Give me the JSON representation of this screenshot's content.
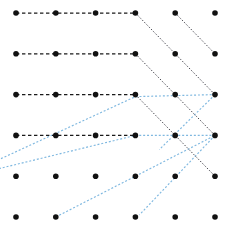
{
  "canvas": {
    "width": 233,
    "height": 235,
    "background": "#ffffff",
    "title": "dot-grid routing diagram"
  },
  "grid": {
    "rows": 6,
    "cols": 6,
    "x_origin": 16,
    "y_origin": 13,
    "x_step": 39.8,
    "y_step": 40.8,
    "dot_radius": 2.8,
    "dot_color": "#111111",
    "dot_count": 36
  },
  "styles": {
    "black_dashed": {
      "color": "#1a1a1a",
      "width": 1.25,
      "dash": "3.4 2.6",
      "name": "black-dashed"
    },
    "black_dotted": {
      "color": "#4a4a52",
      "width": 1.0,
      "dash": "1.5 1.7",
      "name": "black-dotted-diagonal"
    },
    "blue_dotted": {
      "color": "#7fb8e0",
      "width": 1.15,
      "dash": "2.0 1.9",
      "name": "blue-dotted-diagonal"
    }
  },
  "paths": {
    "horizontal_black": [
      {
        "name": "row-1-horizontal",
        "points": [
          [
            1,
            1
          ],
          [
            4,
            1
          ]
        ]
      },
      {
        "name": "row-2-horizontal",
        "points": [
          [
            1,
            2
          ],
          [
            4,
            2
          ]
        ]
      },
      {
        "name": "row-3-horizontal",
        "points": [
          [
            1,
            3
          ],
          [
            4,
            3
          ]
        ]
      },
      {
        "name": "row-4-horizontal",
        "points": [
          [
            1,
            4
          ],
          [
            4,
            4
          ]
        ]
      }
    ],
    "diagonal_black": [
      {
        "name": "black-diag-from-r1c4",
        "points": [
          [
            4,
            1
          ],
          [
            6,
            3
          ]
        ]
      },
      {
        "name": "black-diag-from-r2c4",
        "points": [
          [
            4,
            2
          ],
          [
            6,
            4
          ]
        ]
      },
      {
        "name": "black-diag-from-r3c4",
        "points": [
          [
            4,
            3
          ],
          [
            6,
            5
          ]
        ]
      },
      {
        "name": "black-diag-from-r1c5",
        "points": [
          [
            5,
            1
          ],
          [
            6,
            2
          ]
        ]
      }
    ],
    "diagonal_blue": [
      {
        "name": "blue-chevron-upper",
        "points": [
          [
            0.0,
            4.85
          ],
          [
            4,
            3.05
          ],
          [
            6,
            3
          ]
        ]
      },
      {
        "name": "blue-chevron-mid",
        "points": [
          [
            0.0,
            4.95
          ],
          [
            4,
            4.0
          ],
          [
            6,
            4
          ]
        ]
      },
      {
        "name": "blue-chevron-lower",
        "points": [
          [
            2,
            6
          ],
          [
            6,
            4
          ]
        ]
      },
      {
        "name": "blue-edge-right-upper",
        "points": [
          [
            6,
            3
          ],
          [
            4.6,
            4.35
          ]
        ]
      },
      {
        "name": "blue-edge-right-lower",
        "points": [
          [
            6,
            4
          ],
          [
            4.1,
            5.95
          ]
        ]
      }
    ]
  },
  "legend": {
    "visible": false,
    "entries": []
  }
}
